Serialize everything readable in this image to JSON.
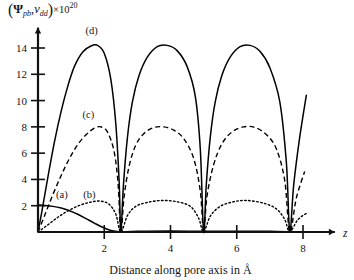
{
  "chart_data": {
    "type": "line",
    "title": "",
    "xlabel": "Distance along pore axis in Å",
    "ylabel_parts": {
      "open_paren": "(",
      "psi": "Ψ",
      "psi_sub": "pb",
      "comma": ",",
      "v": "v",
      "v_sub": "dd",
      "close_paren": ")",
      "multiplier": "×10",
      "exponent": "20"
    },
    "x_axis_name": "z",
    "xlim": [
      0,
      8.6
    ],
    "xticks": [
      2,
      4,
      6,
      8
    ],
    "xtick_labels": [
      "2",
      "4",
      "6",
      "8"
    ],
    "ylim": [
      0,
      15.4
    ],
    "yticks": [
      2,
      4,
      6,
      8,
      10,
      12,
      14
    ],
    "ytick_labels": [
      "2",
      "4",
      "6",
      "8",
      "10",
      "12",
      "14"
    ],
    "grid": false,
    "legend_position": "inline-annotations",
    "nodes_z": [
      2.5,
      5.0,
      7.6
    ],
    "series": [
      {
        "name": "(a)",
        "style": "solid",
        "label": "(a)",
        "label_z": 0.72,
        "label_y": 2.55,
        "peak": 2.05,
        "points": [
          [
            0.0,
            2.05
          ],
          [
            0.2,
            2.02
          ],
          [
            0.45,
            1.95
          ],
          [
            0.7,
            1.82
          ],
          [
            0.95,
            1.62
          ],
          [
            1.2,
            1.35
          ],
          [
            1.45,
            1.02
          ],
          [
            1.7,
            0.68
          ],
          [
            1.95,
            0.36
          ],
          [
            2.2,
            0.12
          ],
          [
            2.45,
            0.02
          ],
          [
            2.5,
            0.0
          ],
          [
            3.0,
            0.05
          ],
          [
            4.0,
            0.08
          ],
          [
            5.0,
            0.05
          ],
          [
            6.0,
            0.06
          ],
          [
            7.0,
            0.05
          ],
          [
            7.6,
            0.0
          ]
        ]
      },
      {
        "name": "(b)",
        "style": "dotted",
        "label": "(b)",
        "label_z": 1.55,
        "label_y": 2.6,
        "peak": 2.35,
        "points": [
          [
            0.0,
            0.0
          ],
          [
            0.3,
            0.55
          ],
          [
            0.6,
            1.12
          ],
          [
            0.9,
            1.6
          ],
          [
            1.25,
            2.02
          ],
          [
            1.6,
            2.28
          ],
          [
            1.9,
            2.35
          ],
          [
            2.15,
            2.1
          ],
          [
            2.35,
            1.35
          ],
          [
            2.5,
            0.0
          ],
          [
            2.7,
            1.25
          ],
          [
            2.95,
            1.95
          ],
          [
            3.3,
            2.25
          ],
          [
            3.75,
            2.4
          ],
          [
            4.2,
            2.3
          ],
          [
            4.6,
            1.95
          ],
          [
            4.85,
            1.05
          ],
          [
            5.0,
            0.0
          ],
          [
            5.2,
            1.2
          ],
          [
            5.5,
            1.95
          ],
          [
            5.9,
            2.3
          ],
          [
            6.3,
            2.4
          ],
          [
            6.8,
            2.2
          ],
          [
            7.2,
            1.75
          ],
          [
            7.45,
            0.95
          ],
          [
            7.6,
            0.0
          ],
          [
            7.85,
            0.95
          ],
          [
            8.15,
            1.5
          ]
        ]
      },
      {
        "name": "(c)",
        "style": "dashed",
        "label": "(c)",
        "label_z": 1.52,
        "label_y": 8.7,
        "peak": 8.0,
        "points": [
          [
            0.0,
            0.0
          ],
          [
            0.2,
            1.25
          ],
          [
            0.45,
            2.85
          ],
          [
            0.7,
            4.3
          ],
          [
            0.95,
            5.6
          ],
          [
            1.2,
            6.65
          ],
          [
            1.45,
            7.4
          ],
          [
            1.7,
            7.9
          ],
          [
            1.9,
            8.0
          ],
          [
            2.1,
            7.6
          ],
          [
            2.3,
            6.1
          ],
          [
            2.42,
            3.6
          ],
          [
            2.5,
            0.0
          ],
          [
            2.6,
            2.7
          ],
          [
            2.75,
            5.0
          ],
          [
            2.95,
            6.6
          ],
          [
            3.2,
            7.5
          ],
          [
            3.5,
            7.95
          ],
          [
            3.8,
            8.0
          ],
          [
            4.1,
            7.75
          ],
          [
            4.4,
            7.1
          ],
          [
            4.7,
            5.6
          ],
          [
            4.9,
            3.1
          ],
          [
            5.0,
            0.0
          ],
          [
            5.1,
            2.7
          ],
          [
            5.3,
            5.1
          ],
          [
            5.55,
            6.7
          ],
          [
            5.85,
            7.6
          ],
          [
            6.2,
            8.0
          ],
          [
            6.55,
            7.95
          ],
          [
            6.9,
            7.4
          ],
          [
            7.2,
            6.3
          ],
          [
            7.45,
            3.9
          ],
          [
            7.6,
            0.0
          ],
          [
            7.8,
            2.6
          ],
          [
            8.05,
            4.6
          ]
        ]
      },
      {
        "name": "(d)",
        "style": "solid",
        "label": "(d)",
        "label_z": 1.62,
        "label_y": 15.1,
        "peak": 14.2,
        "points": [
          [
            0.0,
            0.0
          ],
          [
            0.12,
            1.6
          ],
          [
            0.3,
            4.2
          ],
          [
            0.5,
            6.9
          ],
          [
            0.7,
            9.2
          ],
          [
            0.9,
            11.1
          ],
          [
            1.1,
            12.6
          ],
          [
            1.35,
            13.7
          ],
          [
            1.6,
            14.15
          ],
          [
            1.8,
            14.2
          ],
          [
            2.0,
            13.6
          ],
          [
            2.2,
            11.6
          ],
          [
            2.35,
            8.2
          ],
          [
            2.45,
            3.8
          ],
          [
            2.5,
            0.0
          ],
          [
            2.58,
            3.6
          ],
          [
            2.7,
            7.2
          ],
          [
            2.85,
            9.9
          ],
          [
            3.05,
            11.9
          ],
          [
            3.3,
            13.3
          ],
          [
            3.6,
            14.1
          ],
          [
            3.9,
            14.2
          ],
          [
            4.2,
            13.8
          ],
          [
            4.5,
            12.6
          ],
          [
            4.75,
            10.3
          ],
          [
            4.9,
            6.3
          ],
          [
            5.0,
            0.0
          ],
          [
            5.08,
            3.6
          ],
          [
            5.2,
            7.2
          ],
          [
            5.35,
            9.9
          ],
          [
            5.55,
            11.9
          ],
          [
            5.8,
            13.3
          ],
          [
            6.1,
            14.1
          ],
          [
            6.4,
            14.2
          ],
          [
            6.7,
            13.75
          ],
          [
            7.0,
            12.5
          ],
          [
            7.3,
            9.9
          ],
          [
            7.5,
            5.2
          ],
          [
            7.6,
            0.0
          ],
          [
            7.72,
            3.6
          ],
          [
            7.9,
            7.2
          ],
          [
            8.1,
            10.4
          ]
        ]
      }
    ]
  }
}
